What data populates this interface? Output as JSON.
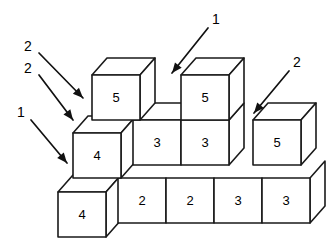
{
  "figure": {
    "background_color": "#ffffff",
    "line_color": "#1a1a1a",
    "face_color": "#ffffff",
    "geometry": {
      "cube_width": 48,
      "cube_height": 45,
      "depth_dx": 15,
      "depth_dy": -17
    },
    "cubes": [
      {
        "id": "cube-bottom-front-4",
        "label": "4",
        "x": 58,
        "y": 192,
        "top": true,
        "right": true
      },
      {
        "id": "cube-row1-2a",
        "label": "2",
        "x": 118,
        "y": 178,
        "top": false,
        "right": false
      },
      {
        "id": "cube-row1-2b",
        "label": "2",
        "x": 166,
        "y": 178,
        "top": false,
        "right": false
      },
      {
        "id": "cube-row1-3a",
        "label": "3",
        "x": 214,
        "y": 178,
        "top": false,
        "right": false
      },
      {
        "id": "cube-row1-3b",
        "label": "3",
        "x": 262,
        "y": 178,
        "top": false,
        "right": true
      },
      {
        "id": "cube-mid-4",
        "label": "4",
        "x": 73,
        "y": 133,
        "top": true,
        "right": true
      },
      {
        "id": "cube-mid-3a",
        "label": "3",
        "x": 133,
        "y": 120,
        "top": true,
        "right": false
      },
      {
        "id": "cube-mid-3b",
        "label": "3",
        "x": 181,
        "y": 120,
        "top": false,
        "right": true
      },
      {
        "id": "cube-right-5",
        "label": "5",
        "x": 253,
        "y": 120,
        "top": true,
        "right": true
      },
      {
        "id": "cube-top-left-5",
        "label": "5",
        "x": 92,
        "y": 75,
        "top": true,
        "right": true
      },
      {
        "id": "cube-top-right-5",
        "label": "5",
        "x": 181,
        "y": 75,
        "top": true,
        "right": true
      }
    ],
    "callouts": [
      {
        "id": "callout-2-upper",
        "label": "2",
        "tx": 28,
        "ty": 47,
        "x1": 39,
        "y1": 53,
        "x2": 83,
        "y2": 98
      },
      {
        "id": "callout-2-lower",
        "label": "2",
        "tx": 28,
        "ty": 69,
        "x1": 39,
        "y1": 75,
        "x2": 73,
        "y2": 120
      },
      {
        "id": "callout-1-left",
        "label": "1",
        "tx": 21,
        "ty": 113,
        "x1": 31,
        "y1": 120,
        "x2": 67,
        "y2": 163
      },
      {
        "id": "callout-1-top",
        "label": "1",
        "tx": 216,
        "ty": 20,
        "x1": 208,
        "y1": 28,
        "x2": 172,
        "y2": 73
      },
      {
        "id": "callout-2-right",
        "label": "2",
        "tx": 297,
        "ty": 63,
        "x1": 289,
        "y1": 71,
        "x2": 254,
        "y2": 113
      }
    ]
  }
}
